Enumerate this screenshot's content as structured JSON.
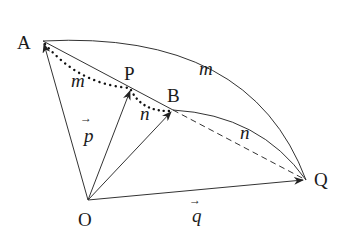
{
  "diagram": {
    "points": {
      "A": {
        "label": "A",
        "x": 43,
        "y": 41
      },
      "P": {
        "label": "P",
        "x": 131,
        "y": 88
      },
      "B": {
        "label": "B",
        "x": 173,
        "y": 110
      },
      "O": {
        "label": "O",
        "x": 88,
        "y": 200
      },
      "Q": {
        "label": "Q",
        "x": 306,
        "y": 180
      }
    },
    "segment_labels": {
      "AP": "m",
      "PB": "n",
      "AQ_arc": "m",
      "BQ_arc": "n"
    },
    "vectors": {
      "p": {
        "label": "p",
        "arrow": "→"
      },
      "q": {
        "label": "q",
        "arrow": "→"
      }
    },
    "colors": {
      "stroke": "#333333",
      "text": "#1a1a1a",
      "background": "#ffffff"
    }
  }
}
